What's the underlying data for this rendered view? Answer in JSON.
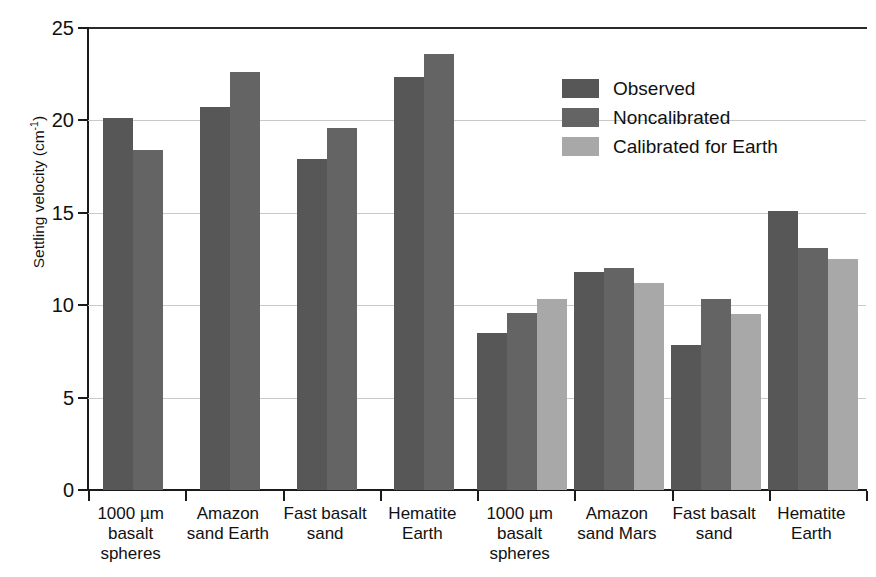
{
  "chart_data": {
    "type": "bar",
    "title": "",
    "xlabel": "",
    "ylabel": "Settling velocity (cm-1)",
    "ylabel_base": "Settling velocity (cm",
    "ylabel_exponent": "-1",
    "ylabel_close": ")",
    "ylim": [
      0,
      25
    ],
    "yticks": [
      0,
      5,
      10,
      15,
      20,
      25
    ],
    "ytick_labels": [
      "0",
      "5",
      "10",
      "15",
      "20",
      "25"
    ],
    "grid": true,
    "grid_axis": "y",
    "legend_position": "upper right",
    "categories": [
      "1000 µm basalt spheres",
      "Amazon sand Earth",
      "Fast basalt sand",
      "Hematite Earth",
      "1000 µm basalt spheres",
      "Amazon sand Mars",
      "Fast basalt sand",
      "Hematite Earth"
    ],
    "category_lines": [
      [
        "1000 µm",
        "basalt",
        "spheres"
      ],
      [
        "Amazon",
        "sand Earth"
      ],
      [
        "Fast basalt",
        "sand"
      ],
      [
        "Hematite",
        "Earth"
      ],
      [
        "1000 µm",
        "basalt",
        "spheres"
      ],
      [
        "Amazon",
        "sand Mars"
      ],
      [
        "Fast basalt",
        "sand"
      ],
      [
        "Hematite",
        "Earth"
      ]
    ],
    "series": [
      {
        "name": "Observed",
        "color": "#575757",
        "values": [
          20.15,
          20.7,
          17.9,
          22.35,
          8.5,
          11.8,
          7.85,
          15.1
        ]
      },
      {
        "name": "Noncalibrated",
        "color": "#646464",
        "values": [
          18.4,
          22.6,
          19.6,
          23.6,
          9.6,
          12.0,
          10.35,
          13.1
        ]
      },
      {
        "name": "Calibrated for Earth",
        "color": "#a8a8a8",
        "values": [
          null,
          null,
          null,
          null,
          10.35,
          11.2,
          9.55,
          12.5
        ]
      }
    ]
  },
  "legend": {
    "items": [
      {
        "label": "Observed",
        "swatch_class": "observed"
      },
      {
        "label": "Noncalibrated",
        "swatch_class": "noncalibrated"
      },
      {
        "label": "Calibrated for Earth",
        "swatch_class": "calibrated"
      }
    ]
  }
}
